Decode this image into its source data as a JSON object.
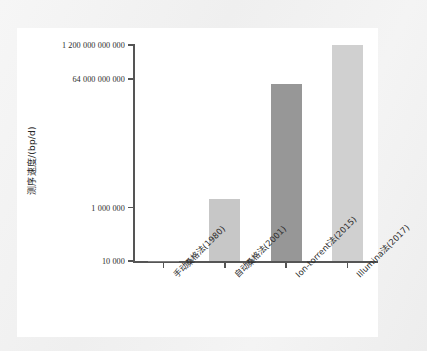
{
  "figure": {
    "background_color": "#ffffff",
    "page_color": "#f2f2f2"
  },
  "chart_data": {
    "type": "bar",
    "title": "",
    "subtitle": "",
    "xlabel": "",
    "ylabel": "测序速度/(bp/d)",
    "yscale": "log",
    "grid": false,
    "legend": false,
    "categories": [
      "手动桑格法(1980)",
      "自动桑格法(2001)",
      "Ion-torrent法(2015)",
      "Illumina法(2017)"
    ],
    "values": [
      10000,
      2000000,
      40000000000,
      1200000000000
    ],
    "value_labels": [
      "10 000",
      "2 000 000",
      "40 000 000 000",
      "1 200 000 000 000"
    ],
    "bar_colors": [
      "#7c7c7c",
      "#c7c7c7",
      "#979797",
      "#d0d0d0"
    ],
    "ytick_labels": [
      "10 000",
      "1 000 000",
      "64 000 000 000",
      "1 200 000 000 000"
    ],
    "ytick_values": [
      10000,
      1000000,
      64000000000,
      1200000000000
    ],
    "ylim": [
      10000,
      1200000000000
    ]
  },
  "axes": {
    "axis_color": "#555555",
    "tick_color": "#555555",
    "label_color": "#2b2b2b"
  }
}
